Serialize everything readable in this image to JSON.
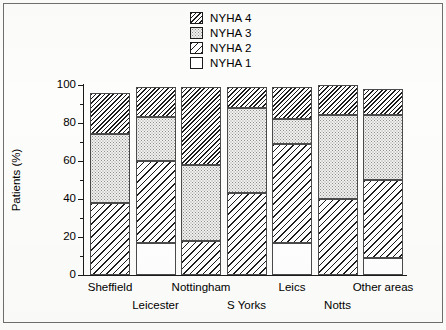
{
  "chart_data": {
    "type": "bar",
    "subtype": "stacked-bar-100",
    "title": "",
    "xlabel": "",
    "ylabel": "Patients (%)",
    "ylim": [
      0,
      100
    ],
    "ytick_labels": [
      "0",
      "20",
      "40",
      "60",
      "80",
      "100"
    ],
    "ytick_values": [
      0,
      20,
      40,
      60,
      80,
      100
    ],
    "yminor_step": 10,
    "grid": false,
    "legend_position": "top-center",
    "categories": [
      "Sheffield",
      "Leicester",
      "Nottingham",
      "S Yorks",
      "Leics",
      "Notts",
      "Other areas"
    ],
    "series": [
      {
        "name": "NYHA 1",
        "pattern": "white",
        "values": [
          0,
          17,
          0,
          0,
          17,
          0,
          9
        ]
      },
      {
        "name": "NYHA 2",
        "pattern": "diagonal-hatch-wide",
        "values": [
          38,
          43,
          18,
          43,
          52,
          40,
          41
        ]
      },
      {
        "name": "NYHA 3",
        "pattern": "stipple-dots",
        "values": [
          36,
          23,
          40,
          45,
          13,
          44,
          34
        ]
      },
      {
        "name": "NYHA 4",
        "pattern": "diagonal-hatch-dense",
        "values": [
          22,
          16,
          41,
          11,
          17,
          16,
          14
        ]
      }
    ],
    "stack_tops": [
      {
        "category": "Sheffield",
        "nyha1": 0,
        "nyha2": 38,
        "nyha3": 74,
        "nyha4": 96
      },
      {
        "category": "Leicester",
        "nyha1": 17,
        "nyha2": 60,
        "nyha3": 83,
        "nyha4": 99
      },
      {
        "category": "Nottingham",
        "nyha1": 0,
        "nyha2": 18,
        "nyha3": 58,
        "nyha4": 99
      },
      {
        "category": "S Yorks",
        "nyha1": 0,
        "nyha2": 43,
        "nyha3": 88,
        "nyha4": 99
      },
      {
        "category": "Leics",
        "nyha1": 17,
        "nyha2": 69,
        "nyha3": 82,
        "nyha4": 99
      },
      {
        "category": "Notts",
        "nyha1": 0,
        "nyha2": 40,
        "nyha3": 84,
        "nyha4": 100
      },
      {
        "category": "Other areas",
        "nyha1": 9,
        "nyha2": 50,
        "nyha3": 84,
        "nyha4": 98
      }
    ]
  },
  "legend": {
    "items": [
      {
        "label": "NYHA 4",
        "swatch": "diagonal-hatch-dense-swatch"
      },
      {
        "label": "NYHA 3",
        "swatch": "stipple-dots-swatch"
      },
      {
        "label": "NYHA 2",
        "swatch": "diagonal-hatch-wide-swatch"
      },
      {
        "label": "NYHA 1",
        "swatch": "white-swatch"
      }
    ]
  },
  "axes": {
    "y_title": "Patients (%)",
    "y_ticks": [
      "100",
      "80",
      "60",
      "40",
      "20",
      "0"
    ],
    "x_labels_upper": [
      "Sheffield",
      "Nottingham",
      "Leics",
      "Other areas"
    ],
    "x_labels_lower": [
      "Leicester",
      "S Yorks",
      "Notts"
    ]
  },
  "colors": {
    "ink": "#1a1a1a",
    "paper": "#fdfdfb",
    "hatch": "#1c1c1c",
    "stipple": "#8d8d8d",
    "segment_border": "#4a4a4a"
  }
}
